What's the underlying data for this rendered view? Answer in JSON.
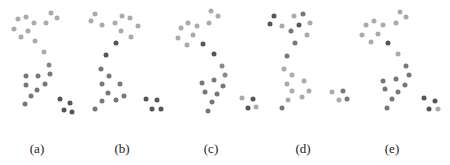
{
  "figure": {
    "panels": [
      {
        "id": "a",
        "label": "(a)",
        "label_x": 37,
        "offset_x": 0,
        "dots": [
          [
            51,
            13,
            "#aaaaaa"
          ],
          [
            18,
            19,
            "#aaaaaa"
          ],
          [
            26,
            17,
            "#aaaaaa"
          ],
          [
            34,
            23,
            "#aaaaaa"
          ],
          [
            46,
            23,
            "#aaaaaa"
          ],
          [
            57,
            18,
            "#aaaaaa"
          ],
          [
            14,
            29,
            "#aaaaaa"
          ],
          [
            28,
            31,
            "#aaaaaa"
          ],
          [
            21,
            37,
            "#aaaaaa"
          ],
          [
            35,
            41,
            "#aaaaaa"
          ],
          [
            44,
            52,
            "#aaaaaa"
          ],
          [
            49,
            65,
            "#888888"
          ],
          [
            26,
            76,
            "#777777"
          ],
          [
            38,
            76,
            "#777777"
          ],
          [
            50,
            74,
            "#777777"
          ],
          [
            26,
            85,
            "#777777"
          ],
          [
            45,
            84,
            "#777777"
          ],
          [
            37,
            90,
            "#777777"
          ],
          [
            31,
            96,
            "#777777"
          ],
          [
            25,
            104,
            "#777777"
          ],
          [
            60,
            99,
            "#555555"
          ],
          [
            70,
            103,
            "#555555"
          ],
          [
            64,
            110,
            "#555555"
          ],
          [
            72,
            112,
            "#555555"
          ]
        ]
      },
      {
        "id": "b",
        "label": "(b)",
        "label_x": 122,
        "offset_x": 80,
        "dots": [
          [
            95,
            14,
            "#aaaaaa"
          ],
          [
            91,
            21,
            "#aaaaaa"
          ],
          [
            102,
            25,
            "#aaaaaa"
          ],
          [
            122,
            16,
            "#aaaaaa"
          ],
          [
            130,
            18,
            "#aaaaaa"
          ],
          [
            115,
            23,
            "#aaaaaa"
          ],
          [
            138,
            26,
            "#aaaaaa"
          ],
          [
            121,
            31,
            "#aaaaaa"
          ],
          [
            131,
            37,
            "#aaaaaa"
          ],
          [
            116,
            43,
            "#555555"
          ],
          [
            106,
            55,
            "#555555"
          ],
          [
            101,
            69,
            "#777777"
          ],
          [
            109,
            76,
            "#777777"
          ],
          [
            102,
            84,
            "#777777"
          ],
          [
            120,
            84,
            "#777777"
          ],
          [
            108,
            93,
            "#777777"
          ],
          [
            124,
            96,
            "#777777"
          ],
          [
            102,
            101,
            "#777777"
          ],
          [
            116,
            100,
            "#777777"
          ],
          [
            95,
            109,
            "#777777"
          ],
          [
            146,
            99,
            "#555555"
          ],
          [
            157,
            100,
            "#555555"
          ],
          [
            152,
            109,
            "#555555"
          ],
          [
            161,
            109,
            "#555555"
          ]
        ]
      },
      {
        "id": "c",
        "label": "(c)",
        "label_x": 211,
        "offset_x": 165,
        "dots": [
          [
            211,
            11,
            "#aaaaaa"
          ],
          [
            218,
            16,
            "#aaaaaa"
          ],
          [
            188,
            23,
            "#aaaaaa"
          ],
          [
            181,
            28,
            "#aaaaaa"
          ],
          [
            197,
            26,
            "#aaaaaa"
          ],
          [
            209,
            23,
            "#aaaaaa"
          ],
          [
            178,
            38,
            "#aaaaaa"
          ],
          [
            193,
            35,
            "#aaaaaa"
          ],
          [
            187,
            45,
            "#aaaaaa"
          ],
          [
            203,
            44,
            "#555555"
          ],
          [
            214,
            54,
            "#555555"
          ],
          [
            222,
            66,
            "#888888"
          ],
          [
            225,
            75,
            "#888888"
          ],
          [
            202,
            83,
            "#777777"
          ],
          [
            214,
            80,
            "#777777"
          ],
          [
            223,
            86,
            "#777777"
          ],
          [
            205,
            92,
            "#777777"
          ],
          [
            217,
            94,
            "#777777"
          ],
          [
            212,
            102,
            "#777777"
          ],
          [
            208,
            111,
            "#777777"
          ],
          [
            242,
            98,
            "#aaaaaa"
          ],
          [
            253,
            99,
            "#555555"
          ],
          [
            248,
            108,
            "#555555"
          ],
          [
            256,
            107,
            "#aaaaaa"
          ]
        ]
      },
      {
        "id": "d",
        "label": "(d)",
        "label_x": 303,
        "offset_x": 255,
        "dots": [
          [
            274,
            16,
            "#555555"
          ],
          [
            270,
            24,
            "#555555"
          ],
          [
            282,
            26,
            "#aaaaaa"
          ],
          [
            294,
            16,
            "#aaaaaa"
          ],
          [
            303,
            14,
            "#777777"
          ],
          [
            299,
            25,
            "#555555"
          ],
          [
            310,
            23,
            "#aaaaaa"
          ],
          [
            291,
            31,
            "#777777"
          ],
          [
            307,
            35,
            "#aaaaaa"
          ],
          [
            295,
            43,
            "#777777"
          ],
          [
            287,
            56,
            "#777777"
          ],
          [
            284,
            69,
            "#aaaaaa"
          ],
          [
            292,
            75,
            "#aaaaaa"
          ],
          [
            287,
            84,
            "#aaaaaa"
          ],
          [
            304,
            81,
            "#aaaaaa"
          ],
          [
            292,
            91,
            "#aaaaaa"
          ],
          [
            309,
            91,
            "#aaaaaa"
          ],
          [
            302,
            97,
            "#aaaaaa"
          ],
          [
            288,
            100,
            "#aaaaaa"
          ],
          [
            282,
            108,
            "#777777"
          ],
          [
            332,
            92,
            "#aaaaaa"
          ],
          [
            343,
            91,
            "#777777"
          ],
          [
            339,
            100,
            "#aaaaaa"
          ],
          [
            347,
            99,
            "#777777"
          ]
        ]
      },
      {
        "id": "e",
        "label": "(e)",
        "label_x": 392,
        "offset_x": 345,
        "dots": [
          [
            400,
            12,
            "#aaaaaa"
          ],
          [
            406,
            17,
            "#aaaaaa"
          ],
          [
            366,
            25,
            "#aaaaaa"
          ],
          [
            374,
            21,
            "#aaaaaa"
          ],
          [
            383,
            25,
            "#aaaaaa"
          ],
          [
            396,
            23,
            "#aaaaaa"
          ],
          [
            362,
            35,
            "#aaaaaa"
          ],
          [
            378,
            34,
            "#aaaaaa"
          ],
          [
            371,
            42,
            "#aaaaaa"
          ],
          [
            388,
            43,
            "#555555"
          ],
          [
            398,
            54,
            "#aaaaaa"
          ],
          [
            406,
            66,
            "#777777"
          ],
          [
            409,
            75,
            "#777777"
          ],
          [
            383,
            81,
            "#777777"
          ],
          [
            396,
            79,
            "#777777"
          ],
          [
            385,
            89,
            "#777777"
          ],
          [
            405,
            85,
            "#777777"
          ],
          [
            398,
            92,
            "#777777"
          ],
          [
            392,
            99,
            "#777777"
          ],
          [
            387,
            108,
            "#777777"
          ],
          [
            424,
            98,
            "#555555"
          ],
          [
            435,
            101,
            "#555555"
          ],
          [
            429,
            109,
            "#555555"
          ],
          [
            438,
            109,
            "#aaaaaa"
          ]
        ]
      }
    ],
    "edge_fragments": [
      [
        2,
        99,
        "#777777"
      ]
    ]
  }
}
